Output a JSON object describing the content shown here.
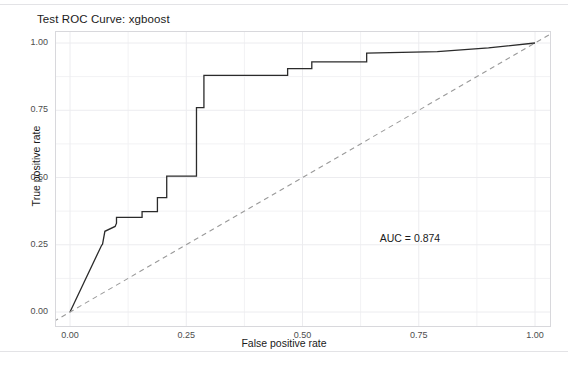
{
  "figure": {
    "background_color": "#ffffff",
    "separator_color": "#e3e3e6"
  },
  "chart_data": {
    "type": "line",
    "title": "Test ROC Curve: xgboost",
    "xlabel": "False positive rate",
    "ylabel": "True positive rate",
    "xlim": [
      0,
      1
    ],
    "ylim": [
      0,
      1
    ],
    "grid": true,
    "grid_major": [
      0.0,
      0.25,
      0.5,
      0.75,
      1.0
    ],
    "grid_minor": [
      0.125,
      0.375,
      0.625,
      0.875
    ],
    "legend_position": "none",
    "xticks": [
      "0.00",
      "0.25",
      "0.50",
      "0.75",
      "1.00"
    ],
    "xtick_values": [
      0.0,
      0.25,
      0.5,
      0.75,
      1.0
    ],
    "yticks": [
      "0.00",
      "0.25",
      "0.50",
      "0.75",
      "1.00"
    ],
    "ytick_values": [
      0.0,
      0.25,
      0.5,
      0.75,
      1.0
    ],
    "annotations": [
      {
        "text": "AUC = 0.874",
        "x": 0.735,
        "y": 0.295
      }
    ],
    "auc": 0.874,
    "series": [
      {
        "name": "ROC curve",
        "style": "solid",
        "color": "#2b2b2b",
        "width": 1.3,
        "x": [
          0.0,
          0.03,
          0.068,
          0.07,
          0.075,
          0.097,
          0.1,
          0.1,
          0.155,
          0.155,
          0.188,
          0.188,
          0.208,
          0.208,
          0.272,
          0.272,
          0.288,
          0.288,
          0.468,
          0.468,
          0.52,
          0.52,
          0.638,
          0.638,
          0.79,
          0.9,
          1.0
        ],
        "y": [
          0.0,
          0.11,
          0.248,
          0.252,
          0.3,
          0.318,
          0.33,
          0.352,
          0.352,
          0.373,
          0.373,
          0.425,
          0.425,
          0.505,
          0.505,
          0.76,
          0.76,
          0.88,
          0.88,
          0.905,
          0.905,
          0.93,
          0.93,
          0.962,
          0.968,
          0.982,
          1.0
        ]
      },
      {
        "name": "Chance diagonal",
        "style": "dashed",
        "color": "#9a9a9a",
        "width": 1.1,
        "x": [
          -0.035,
          1.035
        ],
        "y": [
          -0.035,
          1.035
        ]
      }
    ]
  }
}
